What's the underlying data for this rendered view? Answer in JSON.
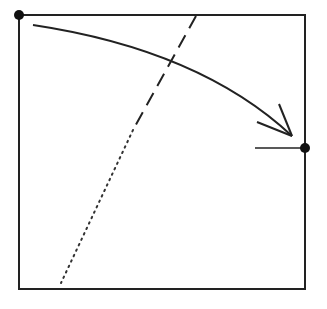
{
  "diagram": {
    "colors": {
      "stroke": "#222222",
      "background": "#ffffff"
    },
    "frame": {
      "x1": 19,
      "y1": 15,
      "x2": 305,
      "y2": 289
    },
    "points": [
      {
        "name": "top-left-corner-dot",
        "x": 19,
        "y": 15,
        "r": 5
      },
      {
        "name": "right-edge-dot",
        "x": 305,
        "y": 148,
        "r": 5
      }
    ],
    "curved_arrow": {
      "start": {
        "x": 33,
        "y": 25
      },
      "control": {
        "x": 200,
        "y": 50
      },
      "end": {
        "x": 292,
        "y": 136
      },
      "head_arm_1": {
        "x": 279,
        "y": 104
      },
      "head_arm_2": {
        "x": 257,
        "y": 122
      }
    },
    "dashed_line": {
      "x1": 196,
      "y1": 16,
      "x2": 133,
      "y2": 130
    },
    "dotted_line": {
      "x1": 133,
      "y1": 130,
      "x2": 61,
      "y2": 283
    },
    "tick_line": {
      "x1": 255,
      "y1": 148,
      "x2": 305,
      "y2": 148
    }
  }
}
